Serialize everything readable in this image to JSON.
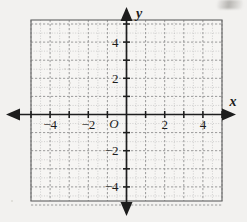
{
  "figure": {
    "kind": "coordinate-plane",
    "background_color": "#f2f1ef",
    "ink_color": "#1d1d1d",
    "grid_major_color": "#9a9a9a",
    "grid_minor_color": "#bdbdbd",
    "plot_border_color": "#6d6d6d",
    "plot_fill_color": "#f6f5f3"
  },
  "axes": {
    "x_label": "x",
    "y_label": "y",
    "origin_label": "O",
    "x_min": -5,
    "x_max": 5,
    "y_min": -5,
    "y_max": 5,
    "major_step": 1,
    "minor_step": 0.5,
    "label_step": 2,
    "arrow_left": "arrow-left",
    "arrow_right": "arrow-right",
    "arrow_up": "arrow-up",
    "arrow_down": "arrow-down"
  },
  "x_tick_labels": [
    {
      "value": -4,
      "text": "−4"
    },
    {
      "value": -2,
      "text": "−2"
    },
    {
      "value": 2,
      "text": "2"
    },
    {
      "value": 4,
      "text": "4"
    }
  ],
  "y_tick_labels": [
    {
      "value": 4,
      "text": "4"
    },
    {
      "value": 2,
      "text": "2"
    },
    {
      "value": -2,
      "text": "−2"
    },
    {
      "value": -4,
      "text": "−4"
    }
  ],
  "chart_data": {
    "type": "scatter",
    "title": "",
    "subtitle": "",
    "xlabel": "x",
    "ylabel": "y",
    "xlim": [
      -5,
      5
    ],
    "ylim": [
      -5,
      5
    ],
    "xticks": [
      -5,
      -4,
      -3,
      -2,
      -1,
      0,
      1,
      2,
      3,
      4,
      5
    ],
    "yticks": [
      -5,
      -4,
      -3,
      -2,
      -1,
      0,
      1,
      2,
      3,
      4,
      5
    ],
    "xticklabels": [
      "",
      "−4",
      "",
      "−2",
      "",
      "O",
      "",
      "2",
      "",
      "4",
      ""
    ],
    "yticklabels": [
      "",
      "−4",
      "",
      "−2",
      "",
      "",
      "",
      "2",
      "",
      "4",
      ""
    ],
    "grid": true,
    "grid_major_step": 1,
    "grid_minor_step": 0.5,
    "legend": null,
    "series": [],
    "values": [],
    "annotations": []
  }
}
